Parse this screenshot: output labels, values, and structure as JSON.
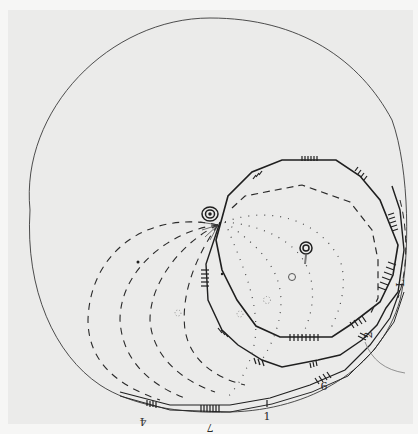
{
  "figure": {
    "type": "hand-drawn sketch",
    "paper_color": "#ebebea",
    "border_color": "#f6f6f5",
    "ink_color": "#2a2a2a",
    "faint_ink_color": "#6a6a6a"
  },
  "labels": [
    {
      "id": "label-4",
      "text": "4",
      "rotated": true
    },
    {
      "id": "label-7",
      "text": "7",
      "rotated": true
    },
    {
      "id": "label-1",
      "text": "1",
      "rotated": false
    },
    {
      "id": "label-9",
      "text": "9",
      "rotated": true
    },
    {
      "id": "label-2",
      "text": "2",
      "rotated": true
    },
    {
      "id": "label-L",
      "text": "L",
      "rotated": true
    }
  ],
  "elements": {
    "outer_circle": "large enclosing circle",
    "inner_polygon": "decagonal outline with hatch marks",
    "outer_polygon": "second polygonal track with hatch marks",
    "dashed_arcs": 4,
    "dotted_arcs": 4,
    "spirals": 2
  }
}
